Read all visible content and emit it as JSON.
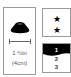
{
  "size_panel": {
    "icon": "cap-disc-icon",
    "dimension_line": "dimension-line",
    "size_imperial": "1 ½in",
    "size_metric": "(4cm)"
  },
  "rating_panel": {
    "stars": [
      "★",
      "★"
    ],
    "star_count": 2
  },
  "level_panel": {
    "levels": [
      "1",
      "2",
      "3"
    ],
    "highlighted_level": "1",
    "highlight_color": "#000000"
  }
}
